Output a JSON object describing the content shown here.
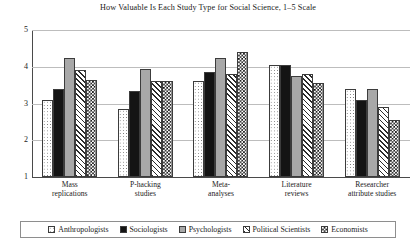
{
  "chart_data": {
    "type": "bar",
    "title": "How Valuable Is Each Study Type for Social Science, 1–5 Scale",
    "xlabel": "",
    "ylabel": "",
    "ylim": [
      1,
      5
    ],
    "yticks": [
      "1",
      "2",
      "3",
      "4",
      "5"
    ],
    "grid": true,
    "legend_position": "bottom",
    "categories": [
      "Mass\nreplications",
      "P-hacking\nstudies",
      "Meta-\nanalyses",
      "Literature\nreviews",
      "Researcher\nattribute studies"
    ],
    "category_lines": [
      [
        "Mass",
        "replications"
      ],
      [
        "P-hacking",
        "studies"
      ],
      [
        "Meta-",
        "analyses"
      ],
      [
        "Literature",
        "reviews"
      ],
      [
        "Researcher",
        "attribute studies"
      ]
    ],
    "series": [
      {
        "name": "Anthropologists",
        "pattern": "dots",
        "values": [
          3.1,
          2.85,
          3.6,
          4.05,
          3.4
        ]
      },
      {
        "name": "Sociologists",
        "pattern": "solid-black",
        "values": [
          3.4,
          3.35,
          3.85,
          4.05,
          3.1
        ]
      },
      {
        "name": "Psychologists",
        "pattern": "solid-gray",
        "values": [
          4.25,
          3.95,
          4.25,
          3.75,
          3.4
        ]
      },
      {
        "name": "Political Scientists",
        "pattern": "diagonal",
        "values": [
          3.9,
          3.6,
          3.8,
          3.8,
          2.9
        ]
      },
      {
        "name": "Economists",
        "pattern": "checker",
        "values": [
          3.65,
          3.6,
          4.4,
          3.55,
          2.55
        ]
      }
    ]
  }
}
